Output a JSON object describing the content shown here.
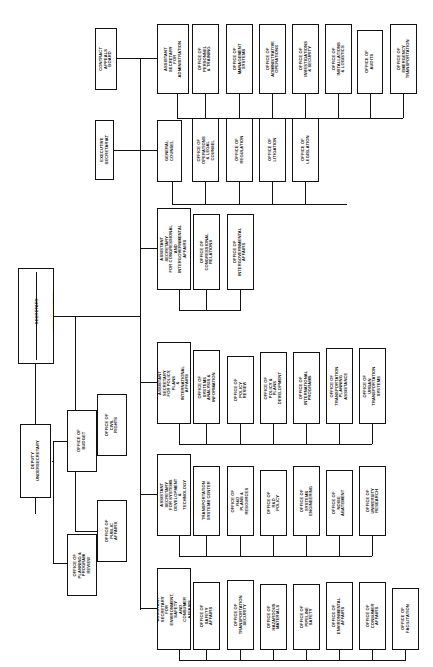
{
  "chart_title": "Department of Transportation Organization Chart",
  "orientation": "rotated-90",
  "nodes": {
    "secretary": "SECRETARY",
    "undersecretary": "UNDERSECRETARY",
    "deputy_undersecretary": "DEPUTY UNDERSECRETARY",
    "office_of_budget": "OFFICE OF BUDGET",
    "office_of_planning": "OFFICE OF PLANNING &\nPROGRAM REVIEW",
    "office_of_civil_rights": "OFFICE OF\nCIVIL RIGHTS",
    "office_of_public_affairs": "OFFICE OF\nPUBLIC AFFAIRS",
    "contract_appeals_board": "CONTRACT APPEALS\nBOARD",
    "executive_secretariat": "EXECUTIVE SECRETARIAT",
    "asec_administration": "ASSISTANT SECRETARY\nFOR\nADMINISTRATION",
    "office_personnel_training": "OFFICE OF\nPERSONNEL & TRAINING",
    "office_management_systems": "OFFICE OF\nMANAGEMENT SYSTEMS",
    "office_admin_operations": "OFFICE OF\nADMINISTRATIVE OPERATIONS",
    "office_investigations_security": "OFFICE OF INVESTIGATIONS\n& SECURITY",
    "office_installations_logistics": "OFFICE OF INSTALLATIONS\n& LOGISTICS",
    "office_audits": "OFFICE OF AUDITS",
    "office_emergency_transportation": "OFFICE OF EMERGENCY\nTRANSPORTATION",
    "general_counsel": "GENERAL COUNSEL",
    "office_operations_legal_counsel": "OFFICE OF OPERATIONS\n& LEGAL COUNSEL",
    "office_regulation": "OFFICE OF\nREGULATION",
    "office_litigation": "OFFICE OF\nLITIGATION",
    "office_legislation": "OFFICE OF\nLEGISLATION",
    "asec_congressional": "ASSISTANT SECRETARY\nFOR CONGRESSIONAL AND\nINTERGOVERNMENTAL AFFAIRS",
    "office_congressional_relations": "OFFICE OF\nCONGRESSIONAL RELATIONS",
    "office_intergovernmental_affairs": "OFFICE OF\nINTERGOVERNMENTAL AFFAIRS",
    "asec_policy": "ASSISTANT SECRETARY\nFOR POLICY, PLANS\n& INTERNATIONAL AFFAIRS",
    "office_systems_analysis": "OFFICE OF SYSTEMS\nANALYSIS & INFORMATION",
    "office_policy_review": "OFFICE OF\nPOLICY REVIEW",
    "office_policy_plans_dev": "OFFICE OF POLICY &\nPLANS DEVELOPMENT",
    "office_international_programs": "OFFICE OF INTERNATIONAL\nPROGRAMS",
    "office_transportation_planning": "OFFICE OF TRANSPORTATION\nPLANNING ASSISTANCE",
    "office_urban_transportation": "OFFICE OF URBAN\nTRANSPORTATION SYSTEMS",
    "asec_systems_dev": "ASSISTANT SECRETARY\nFOR SYSTEMS DEVELOPMENT\n& TECHNOLOGY",
    "transportation_systems_center": "TRANSPORTATION\nSYSTEMS CENTER",
    "office_rd_plans_resources": "OFFICE OF R&D\nPLANS & RESOURCES",
    "office_rd_policy": "OFFICE OF R&D POLICY",
    "office_systems_engineering": "OFFICE OF SYSTEMS\nENGINEERING",
    "office_noise_abatement": "OFFICE OF\nNOISE ABATEMENT",
    "office_university_research": "OFFICE OF\nUNIVERSITY RESEARCH",
    "asec_environment": "ASSISTANT SECRETARY\nFOR ENVIRONMENT, SAFETY\nAND CONSUMER AFFAIRS",
    "office_safety_affairs": "OFFICE OF SAFETY AFFAIRS",
    "office_transportation_security": "OFFICE OF\nTRANSPORTATION SECURITY",
    "office_hazardous_materials": "OFFICE OF\nHAZARDOUS MATERIALS",
    "office_pipeline_safety": "OFFICE OF\nPIPELINE SAFETY",
    "office_environmental_affairs": "OFFICE OF\nENVIRONMENTAL AFFAIRS",
    "office_consumer_affairs": "OFFICE OF\nCONSUMER AFFAIRS",
    "office_facilitation": "OFFICE OF\nFACILITATION"
  },
  "colors": {
    "line": "#111111",
    "box_fill": "#ffffff",
    "text": "#111111"
  }
}
